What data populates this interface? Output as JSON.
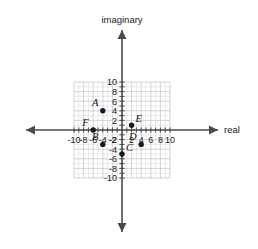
{
  "chart_data": {
    "type": "scatter",
    "title": "",
    "xlabel": "real",
    "ylabel": "imaginary",
    "xlim": [
      -10,
      10
    ],
    "ylim": [
      -10,
      10
    ],
    "grid": true,
    "grid_minor_step": 1,
    "grid_major_step": 2,
    "legend": "none",
    "xticks": [
      -10,
      -8,
      -6,
      -4,
      -2,
      2,
      4,
      6,
      8,
      10
    ],
    "yticks": [
      10,
      8,
      6,
      4,
      2,
      -2,
      -4,
      -6,
      -8,
      -10
    ],
    "xtick_labels": [
      "-10",
      "-8",
      "-6",
      "-4",
      "-2",
      "2",
      "4",
      "6",
      "8",
      "10"
    ],
    "ytick_labels": [
      "10",
      "8",
      "6",
      "4",
      "2",
      "-2",
      "-4",
      "-6",
      "-8",
      "-10"
    ],
    "points": [
      {
        "label": "A",
        "x": -4,
        "y": 4,
        "label_pos": "upper-left"
      },
      {
        "label": "B",
        "x": -4,
        "y": -3,
        "label_pos": "upper-left"
      },
      {
        "label": "C",
        "x": 0,
        "y": -5,
        "label_pos": "upper-right"
      },
      {
        "label": "D",
        "x": 4,
        "y": -3,
        "label_pos": "upper-left"
      },
      {
        "label": "E",
        "x": 2,
        "y": 1,
        "label_pos": "upper-right"
      },
      {
        "label": "F",
        "x": -6,
        "y": 0,
        "label_pos": "upper-left"
      }
    ]
  },
  "axes": {
    "imaginary_label": "imaginary",
    "real_label": "real"
  },
  "colors": {
    "background": "#ffffff",
    "minor_grid": "#e3e3e6",
    "major_grid": "#c8c8cc",
    "axis": "#4a4a4a",
    "point": "#1a1a1a",
    "text": "#1a1a1a"
  }
}
